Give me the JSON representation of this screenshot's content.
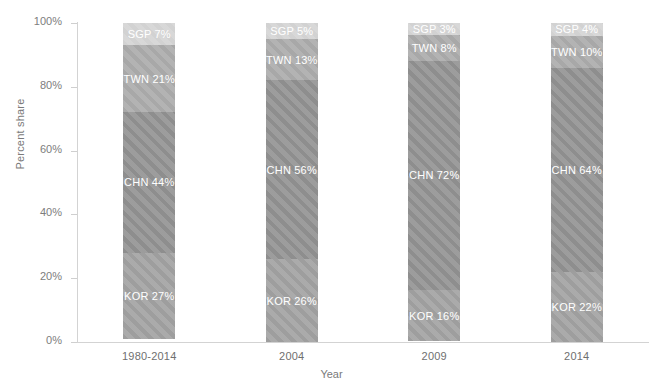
{
  "chart_data": {
    "type": "bar",
    "subtype": "stacked-100-percent",
    "title": "",
    "xlabel": "Year",
    "ylabel": "Percent share",
    "categories": [
      "1980-2014",
      "2004",
      "2009",
      "2014"
    ],
    "ylim": [
      0,
      100
    ],
    "ytick_labels": [
      "0%",
      "20%",
      "40%",
      "60%",
      "80%",
      "100%"
    ],
    "ytick_values": [
      0,
      20,
      40,
      60,
      80,
      100
    ],
    "grid": false,
    "legend": "none",
    "stack_order_bottom_to_top": [
      "KOR",
      "CHN",
      "TWN",
      "SGP"
    ],
    "series": [
      {
        "name": "KOR",
        "color": "#9e9e9e",
        "values": [
          27,
          26,
          16,
          22
        ]
      },
      {
        "name": "CHN",
        "color": "#8e8e8e",
        "values": [
          44,
          56,
          72,
          64
        ]
      },
      {
        "name": "TWN",
        "color": "#a8a8a8",
        "values": [
          21,
          13,
          8,
          10
        ]
      },
      {
        "name": "SGP",
        "color": "#d2d2d2",
        "values": [
          7,
          5,
          3,
          4
        ]
      }
    ],
    "bars": [
      {
        "category": "1980-2014",
        "segments": [
          {
            "code": "SGP",
            "value": 7,
            "label": "SGP 7%"
          },
          {
            "code": "TWN",
            "value": 21,
            "label": "TWN 21%"
          },
          {
            "code": "CHN",
            "value": 44,
            "label": "CHN 44%"
          },
          {
            "code": "KOR",
            "value": 27,
            "label": "KOR 27%"
          }
        ]
      },
      {
        "category": "2004",
        "segments": [
          {
            "code": "SGP",
            "value": 5,
            "label": "SGP 5%"
          },
          {
            "code": "TWN",
            "value": 13,
            "label": "TWN 13%"
          },
          {
            "code": "CHN",
            "value": 56,
            "label": "CHN 56%"
          },
          {
            "code": "KOR",
            "value": 26,
            "label": "KOR 26%"
          }
        ]
      },
      {
        "category": "2009",
        "segments": [
          {
            "code": "SGP",
            "value": 3,
            "label": "SGP 3%"
          },
          {
            "code": "TWN",
            "value": 8,
            "label": "TWN 8%"
          },
          {
            "code": "CHN",
            "value": 72,
            "label": "CHN 72%"
          },
          {
            "code": "KOR",
            "value": 16,
            "label": "KOR 16%"
          }
        ]
      },
      {
        "category": "2014",
        "segments": [
          {
            "code": "SGP",
            "value": 4,
            "label": "SGP 4%"
          },
          {
            "code": "TWN",
            "value": 10,
            "label": "TWN 10%"
          },
          {
            "code": "CHN",
            "value": 64,
            "label": "CHN 64%"
          },
          {
            "code": "KOR",
            "value": 22,
            "label": "KOR 22%"
          }
        ]
      }
    ]
  },
  "colors": {
    "axis": "#d3d3d3",
    "tick": "#cfcfcf",
    "text": "#6f6f6f",
    "label_text": "#ffffff",
    "background": "#ffffff"
  }
}
